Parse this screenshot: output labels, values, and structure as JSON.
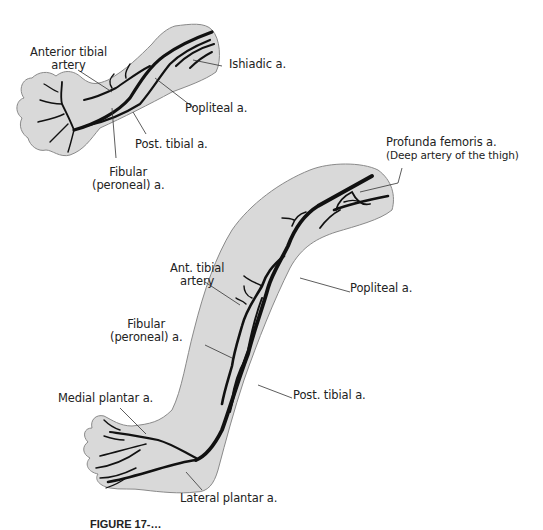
{
  "figure": {
    "type": "anatomical-diagram",
    "colors": {
      "skin_fill": "#d9d9d9",
      "outline": "#8a8a8a",
      "artery": "#111111",
      "leader_line": "#333333",
      "text": "#222222",
      "background": "#ffffff"
    },
    "small_limb": {
      "labels": {
        "anterior_tibial": [
          "Anterior tibial",
          "artery"
        ],
        "ishiadic": "Ishiadic a.",
        "popliteal": "Popliteal a.",
        "post_tibial": "Post. tibial a.",
        "fibular": [
          "Fibular",
          "(peroneal) a."
        ]
      }
    },
    "large_limb": {
      "labels": {
        "profunda_femoris": [
          "Profunda femoris a.",
          "(Deep artery of the thigh)"
        ],
        "ant_tibial": [
          "Ant. tibial",
          "artery"
        ],
        "popliteal": "Popliteal a.",
        "fibular": [
          "Fibular",
          "(peroneal) a."
        ],
        "post_tibial": "Post. tibial a.",
        "medial_plantar": "Medial plantar  a.",
        "lateral_plantar": "Lateral plantar  a."
      }
    },
    "caption": {
      "visible_text": "FIGURE 17-…",
      "truncated": true
    }
  }
}
